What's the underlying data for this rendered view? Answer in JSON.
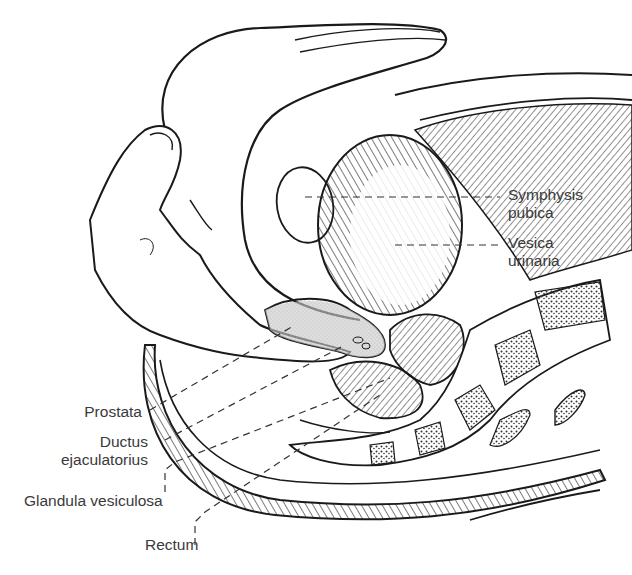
{
  "figure": {
    "colors": {
      "ink": "#1a1a1a",
      "label_text": "#3a3a3a",
      "prostate_fill": "#c8c8c8",
      "background": "#ffffff"
    },
    "labels": {
      "symphysis_line1": "Symphysis",
      "symphysis_line2": "pubica",
      "vesica_line1": "Vesica",
      "vesica_line2": "urinaria",
      "prostata": "Prostata",
      "ductus_line1": "Ductus",
      "ductus_line2": "ejaculatorius",
      "glandula": "Glandula vesiculosa",
      "rectum": "Rectum"
    }
  }
}
